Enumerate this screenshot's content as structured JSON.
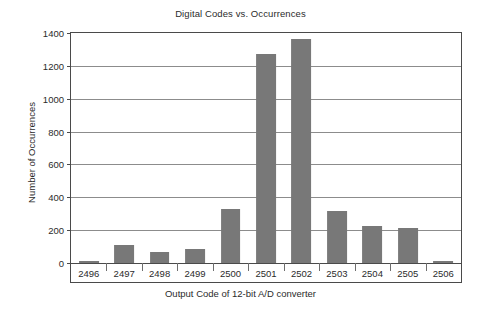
{
  "chart_data": {
    "type": "bar",
    "title": "Digital Codes vs. Occurrences",
    "xlabel": "Output Code of 12-bit A/D converter",
    "ylabel": "Number of Occurrences",
    "categories": [
      "2496",
      "2497",
      "2498",
      "2499",
      "2500",
      "2501",
      "2502",
      "2503",
      "2504",
      "2505",
      "2506"
    ],
    "values": [
      15,
      110,
      65,
      85,
      330,
      1270,
      1365,
      317,
      225,
      216,
      10
    ],
    "ylim": [
      0,
      1400
    ],
    "yticks": [
      0,
      200,
      400,
      600,
      800,
      1000,
      1200,
      1400
    ],
    "ytick_labels": [
      "0",
      "200",
      "400",
      "600",
      "800",
      "1000",
      "1200",
      "1400"
    ],
    "grid": true,
    "legend": "none",
    "bar_color": "#787878",
    "axis_color": "#4a4a4a",
    "gridline_color": "#8c8c8c",
    "background_color": "#ffffff"
  }
}
